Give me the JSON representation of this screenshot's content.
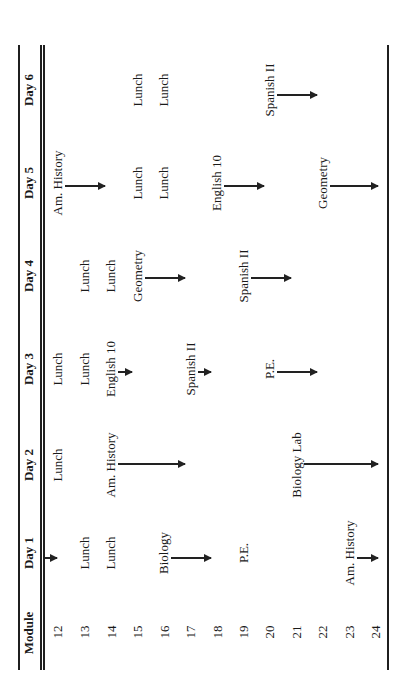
{
  "table": {
    "headers": {
      "module": "Module",
      "days": [
        "Day 1",
        "Day 2",
        "Day 3",
        "Day 4",
        "Day 5",
        "Day 6"
      ]
    },
    "modules": [
      "12",
      "13",
      "14",
      "15",
      "16",
      "17",
      "18",
      "19",
      "20",
      "21",
      "22",
      "23",
      "24"
    ],
    "entries": [
      {
        "day": 1,
        "module": 12,
        "subject": "",
        "arrow_to": 12.2
      },
      {
        "day": 1,
        "module": 13,
        "subject": "Lunch"
      },
      {
        "day": 1,
        "module": 14,
        "subject": "Lunch"
      },
      {
        "day": 1,
        "module": 16,
        "subject": "Biology",
        "arrow_to": 18
      },
      {
        "day": 1,
        "module": 19,
        "subject": "P.E."
      },
      {
        "day": 1,
        "module": 23,
        "subject": "Am. History",
        "arrow_to": 24.3
      },
      {
        "day": 2,
        "module": 12,
        "subject": "Lunch"
      },
      {
        "day": 2,
        "module": 14,
        "subject": "Am. History",
        "arrow_to": 17
      },
      {
        "day": 2,
        "module": 21,
        "subject": "Biology Lab",
        "arrow_to": 24.3
      },
      {
        "day": 3,
        "module": 12,
        "subject": "Lunch"
      },
      {
        "day": 3,
        "module": 13,
        "subject": "Lunch"
      },
      {
        "day": 3,
        "module": 14,
        "subject": "English 10",
        "arrow_to": 15
      },
      {
        "day": 3,
        "module": 17,
        "subject": "Spanish II",
        "arrow_to": 18
      },
      {
        "day": 3,
        "module": 20,
        "subject": "P.E.",
        "arrow_to": 22
      },
      {
        "day": 4,
        "module": 13,
        "subject": "Lunch"
      },
      {
        "day": 4,
        "module": 14,
        "subject": "Lunch"
      },
      {
        "day": 4,
        "module": 15,
        "subject": "Geometry",
        "arrow_to": 17
      },
      {
        "day": 4,
        "module": 19,
        "subject": "Spanish II",
        "arrow_to": 21
      },
      {
        "day": 5,
        "module": 12,
        "subject": "Am. History",
        "arrow_to": 14
      },
      {
        "day": 5,
        "module": 15,
        "subject": "Lunch"
      },
      {
        "day": 5,
        "module": 16,
        "subject": "Lunch"
      },
      {
        "day": 5,
        "module": 18,
        "subject": "English 10",
        "arrow_to": 20
      },
      {
        "day": 5,
        "module": 22,
        "subject": "Geometry",
        "arrow_to": 24.3
      },
      {
        "day": 6,
        "module": 15,
        "subject": "Lunch"
      },
      {
        "day": 6,
        "module": 16,
        "subject": "Lunch"
      },
      {
        "day": 6,
        "module": 20,
        "subject": "Spanish II",
        "arrow_to": 22
      }
    ],
    "colors": {
      "ink": "#1f1f1f",
      "background": "#ffffff"
    }
  }
}
